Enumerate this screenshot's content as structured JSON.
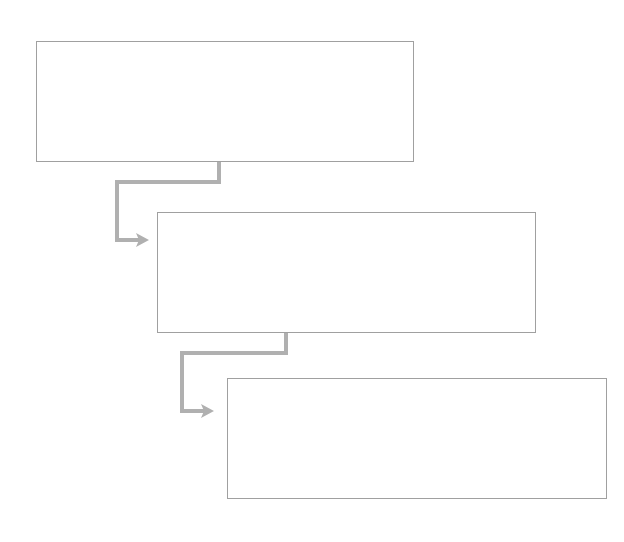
{
  "diagram": {
    "type": "cascading-flow",
    "colors": {
      "box_border": "#a0a0a0",
      "connector": "#b0b0b0",
      "background": "#ffffff"
    },
    "boxes": [
      {
        "id": "step-1",
        "label": "",
        "x": 36,
        "y": 41,
        "w": 377,
        "h": 120
      },
      {
        "id": "step-2",
        "label": "",
        "x": 157,
        "y": 212,
        "w": 378,
        "h": 120
      },
      {
        "id": "step-3",
        "label": "",
        "x": 227,
        "y": 378,
        "w": 379,
        "h": 120
      }
    ],
    "connectors": [
      {
        "from": "step-1",
        "to": "step-2"
      },
      {
        "from": "step-2",
        "to": "step-3"
      }
    ]
  }
}
